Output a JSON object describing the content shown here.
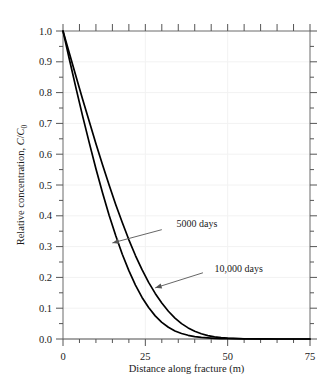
{
  "chart_data": {
    "type": "line",
    "title": "",
    "xlabel": "Distance along fracture (m)",
    "ylabel": "Relative concentration, C/C0",
    "ylabel_parts": {
      "prefix": "Relative concentration, ",
      "symbol_c_numerator": "C",
      "slash": "/",
      "symbol_c_denominator": "C",
      "subscript": "0"
    },
    "xlim": [
      0,
      75
    ],
    "ylim": [
      0,
      1.0
    ],
    "x_major_ticks": [
      0,
      25,
      50,
      75
    ],
    "x_major_tick_labels": [
      "0",
      "25",
      "50",
      "75"
    ],
    "x_minor_tick_step": 5,
    "y_major_ticks": [
      0.0,
      0.1,
      0.2,
      0.3,
      0.4,
      0.5,
      0.6,
      0.7,
      0.8,
      0.9,
      1.0
    ],
    "y_major_tick_labels": [
      "0.0",
      "0.1",
      "0.2",
      "0.3",
      "0.4",
      "0.5",
      "0.6",
      "0.7",
      "0.8",
      "0.9",
      "1.0"
    ],
    "y_minor_tick_step": 0.05,
    "grid": true,
    "grid_color": "#f2f2f2",
    "axis_color": "#555555",
    "curve_color": "#000000",
    "legend_position": "inline-annotations",
    "series": [
      {
        "name": "5000 days",
        "label": "5000 days",
        "x": [
          0,
          2,
          4,
          6,
          8,
          10,
          12,
          14,
          16,
          18,
          20,
          22,
          24,
          26,
          28,
          30,
          32,
          34,
          36,
          38,
          40,
          42,
          44,
          46,
          48,
          50,
          55,
          60,
          65,
          70,
          75
        ],
        "values": [
          1.0,
          0.905,
          0.812,
          0.722,
          0.636,
          0.553,
          0.475,
          0.402,
          0.336,
          0.275,
          0.222,
          0.175,
          0.135,
          0.102,
          0.075,
          0.054,
          0.038,
          0.026,
          0.018,
          0.012,
          0.008,
          0.005,
          0.0034,
          0.0022,
          0.0014,
          0.0009,
          0.0003,
          0.0001,
          0.0,
          0.0,
          0.0
        ]
      },
      {
        "name": "10,000 days",
        "label": "10,000 days",
        "x": [
          0,
          2,
          4,
          6,
          8,
          10,
          12,
          14,
          16,
          18,
          20,
          22,
          24,
          26,
          28,
          30,
          32,
          34,
          36,
          38,
          40,
          42,
          44,
          46,
          48,
          50,
          55,
          60,
          65,
          70,
          75
        ],
        "values": [
          1.0,
          0.925,
          0.851,
          0.777,
          0.705,
          0.634,
          0.566,
          0.5,
          0.437,
          0.378,
          0.322,
          0.271,
          0.225,
          0.184,
          0.148,
          0.117,
          0.09,
          0.068,
          0.05,
          0.036,
          0.025,
          0.017,
          0.011,
          0.007,
          0.0045,
          0.0028,
          0.0008,
          0.0002,
          0.0,
          0.0,
          0.0
        ]
      }
    ],
    "annotations": [
      {
        "name": "annotation-5000-days",
        "text": "5000 days",
        "text_x": 34.5,
        "text_y": 0.375,
        "arrow_from_x": 30.0,
        "arrow_from_y": 0.355,
        "arrow_to_x": 15.0,
        "arrow_to_y": 0.312
      },
      {
        "name": "annotation-10000-days",
        "text": "10,000 days",
        "text_x": 46.0,
        "text_y": 0.228,
        "arrow_from_x": 42.5,
        "arrow_from_y": 0.215,
        "arrow_to_x": 28.0,
        "arrow_to_y": 0.166
      }
    ]
  }
}
